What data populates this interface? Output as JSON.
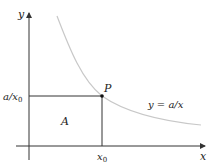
{
  "diagram": {
    "axes": {
      "x_label": "x",
      "y_label": "y"
    },
    "curve": {
      "label": "y = a/x",
      "color": "#c8c8c8"
    },
    "point": {
      "label": "P"
    },
    "tick_x": {
      "label": "x0",
      "base": "x",
      "sub": "0"
    },
    "tick_y": {
      "label": "a/x0",
      "base": "a/x",
      "sub": "0"
    },
    "region": {
      "label": "A"
    },
    "colors": {
      "axis": "#333333",
      "lines": "#333333",
      "curve": "#c8c8c8"
    }
  }
}
